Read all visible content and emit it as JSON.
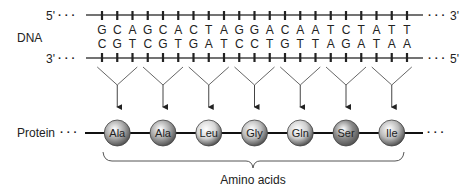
{
  "labels": {
    "dna": "DNA",
    "protein": "Protein",
    "five_prime_left": "5'",
    "three_prime_left": "3'",
    "three_prime_right": "3'",
    "five_prime_right": "5'",
    "ellipsis": "· · ·",
    "amino_acids": "Amino acids"
  },
  "dna": {
    "top_strand": [
      "G",
      "C",
      "A",
      "G",
      "C",
      "A",
      "C",
      "T",
      "A",
      "G",
      "G",
      "A",
      "C",
      "A",
      "A",
      "T",
      "C",
      "T",
      "A",
      "T",
      "T"
    ],
    "bottom_strand": [
      "C",
      "G",
      "T",
      "C",
      "G",
      "T",
      "G",
      "A",
      "T",
      "C",
      "C",
      "T",
      "G",
      "T",
      "T",
      "A",
      "G",
      "A",
      "T",
      "A",
      "A"
    ]
  },
  "codons": [
    {
      "bases": "GCA",
      "amino_acid": "Ala",
      "color": "#a9a9a9"
    },
    {
      "bases": "GCA",
      "amino_acid": "Ala",
      "color": "#a9a9a9"
    },
    {
      "bases": "CTA",
      "amino_acid": "Leu",
      "color": "#d6d6d6"
    },
    {
      "bases": "GGA",
      "amino_acid": "Gly",
      "color": "#bdbdbd"
    },
    {
      "bases": "CAA",
      "amino_acid": "Gln",
      "color": "#cfcfcf"
    },
    {
      "bases": "TCT",
      "amino_acid": "Ser",
      "color": "#8a8a8a"
    },
    {
      "bases": "ATT",
      "amino_acid": "Ile",
      "color": "#bcbcbc"
    }
  ]
}
